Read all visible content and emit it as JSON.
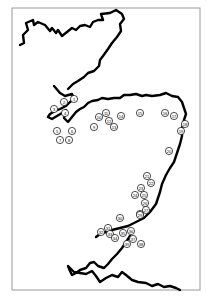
{
  "map": {
    "frame": {
      "x": 12,
      "y": 8,
      "w": 188,
      "h": 282
    },
    "coastlines": [
      "M20,45 L24,43 L23,35 L28,30 L26,23 L33,20 L34,25 L38,22 L45,25 L50,31 L52,28 L56,33 L58,30 L62,36 L67,32 L72,28 L76,30 L80,26 L85,25 L90,27 L93,22 L98,20 L103,20 L101,14 L110,13 L116,10 L122,14 L124,19 L120,24 L121,31 L117,37 L112,43 L108,49 L103,56 L100,60 L99,66 L94,71 L88,73 L84,77 L78,81 L73,84 L68,89",
      "M54,86 L60,93 L65,96 L72,94 L74,99 L70,102 L66,106 L60,109 L55,111 L50,114 L48,117 L52,119 L57,116 L62,113 L66,110 L64,118 L68,122 L72,117 L76,112 L80,109 L84,107 L88,103 L92,101 L98,100 L102,98 L108,99 L114,98 L120,98 L124,95 L130,95 L136,94 L142,96 L146,95 L152,96 L160,95 L166,93 L172,96 L178,97 L182,102 L184,108 L186,114 L184,120 L182,128 L182,136 L180,144 L178,150 L176,156 L174,162 L170,168 L166,175 L162,184 L160,192 L158,198 L156,204 L150,212 L144,218 L136,222 L128,226 L120,228 L112,230 L106,232 L100,234 L96,237",
      "M130,236 L126,242 L122,248 L117,254 L112,259 L108,264 L104,268 L98,266 L94,262 L90,263 L86,268 L80,270 L76,273 L72,275 L70,271 L68,266 L74,272 L86,274 L92,271 L96,276 L100,282 L106,278 L112,275 L118,277 L122,272 L126,275 L132,280 L138,282 L146,283 L152,286 L158,284 L164,287 L170,286 L176,288 L180,290"
    ],
    "sites": [
      {
        "id": "1",
        "x": 74,
        "y": 99
      },
      {
        "id": "2",
        "x": 64,
        "y": 102
      },
      {
        "id": "3",
        "x": 54,
        "y": 109
      },
      {
        "id": "4",
        "x": 65,
        "y": 113
      },
      {
        "id": "5",
        "x": 57,
        "y": 131
      },
      {
        "id": "6",
        "x": 72,
        "y": 131
      },
      {
        "id": "7",
        "x": 60,
        "y": 140
      },
      {
        "id": "8",
        "x": 69,
        "y": 140
      },
      {
        "id": "9",
        "x": 94,
        "y": 127
      },
      {
        "id": "10",
        "x": 99,
        "y": 117
      },
      {
        "id": "11",
        "x": 106,
        "y": 113
      },
      {
        "id": "12",
        "x": 109,
        "y": 121
      },
      {
        "id": "13",
        "x": 114,
        "y": 127
      },
      {
        "id": "14",
        "x": 121,
        "y": 116
      },
      {
        "id": "15",
        "x": 140,
        "y": 113
      },
      {
        "id": "16",
        "x": 165,
        "y": 113
      },
      {
        "id": "17",
        "x": 174,
        "y": 116
      },
      {
        "id": "18",
        "x": 185,
        "y": 124
      },
      {
        "id": "19",
        "x": 181,
        "y": 131
      },
      {
        "id": "20",
        "x": 169,
        "y": 151
      },
      {
        "id": "21",
        "x": 147,
        "y": 176
      },
      {
        "id": "22",
        "x": 151,
        "y": 183
      },
      {
        "id": "23",
        "x": 141,
        "y": 188
      },
      {
        "id": "24",
        "x": 135,
        "y": 195
      },
      {
        "id": "25",
        "x": 144,
        "y": 195
      },
      {
        "id": "26",
        "x": 145,
        "y": 203
      },
      {
        "id": "27",
        "x": 146,
        "y": 210
      },
      {
        "id": "28",
        "x": 140,
        "y": 214
      },
      {
        "id": "29",
        "x": 140,
        "y": 215
      },
      {
        "id": "30",
        "x": 120,
        "y": 218
      },
      {
        "id": "31",
        "x": 108,
        "y": 228
      },
      {
        "id": "32",
        "x": 101,
        "y": 232
      },
      {
        "id": "33",
        "x": 110,
        "y": 234
      },
      {
        "id": "34",
        "x": 115,
        "y": 238
      },
      {
        "id": "35",
        "x": 123,
        "y": 233
      },
      {
        "id": "36",
        "x": 131,
        "y": 231
      },
      {
        "id": "37",
        "x": 133,
        "y": 239
      },
      {
        "id": "38",
        "x": 141,
        "y": 244
      },
      {
        "id": "39",
        "x": 127,
        "y": 244
      }
    ]
  }
}
